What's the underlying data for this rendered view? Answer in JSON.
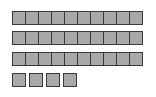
{
  "diagram": {
    "type": "base-ten-blocks",
    "tens_rods": 3,
    "cells_per_rod": 10,
    "units": 4,
    "represented_value": 34,
    "colors": {
      "block_fill": "#a8a8a8",
      "block_border": "#3a3a3a",
      "background": "#ffffff"
    }
  }
}
